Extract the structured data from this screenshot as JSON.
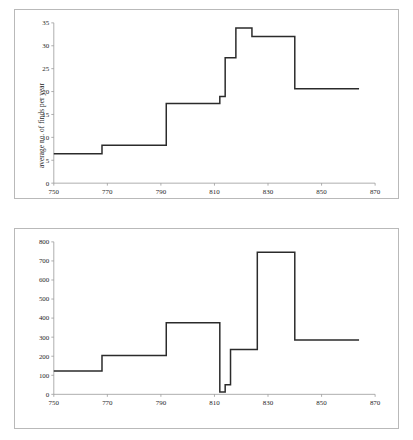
{
  "figure": {
    "background": "#ffffff",
    "frame_color": "#b9b9b9",
    "line_color": "#2b2b2b"
  },
  "chart_data": [
    {
      "type": "line",
      "subtype": "step",
      "id": "average-finds-per-year",
      "title": "",
      "xlabel": "",
      "ylabel": "average no. of finds per year",
      "xlim": [
        750,
        870
      ],
      "ylim": [
        0,
        35
      ],
      "xticks": [
        750,
        770,
        790,
        810,
        830,
        850,
        870
      ],
      "yticks": [
        0,
        5,
        10,
        15,
        20,
        25,
        30,
        35
      ],
      "xticklabels": [
        "750",
        "770",
        "790",
        "810",
        "830",
        "850",
        "870"
      ],
      "yticklabels": [
        "0",
        "5",
        "10",
        "15",
        "20",
        "25",
        "30",
        "35"
      ],
      "grid": false,
      "legend": null,
      "steps": [
        {
          "x_start": 750,
          "x_end": 768,
          "value": 6.4
        },
        {
          "x_start": 768,
          "x_end": 792,
          "value": 8.3
        },
        {
          "x_start": 792,
          "x_end": 812,
          "value": 17.4
        },
        {
          "x_start": 812,
          "x_end": 814,
          "value": 18.9
        },
        {
          "x_start": 814,
          "x_end": 818,
          "value": 27.4
        },
        {
          "x_start": 818,
          "x_end": 824,
          "value": 33.9
        },
        {
          "x_start": 824,
          "x_end": 840,
          "value": 32.0
        },
        {
          "x_start": 840,
          "x_end": 864,
          "value": 20.6
        }
      ]
    },
    {
      "type": "line",
      "subtype": "step",
      "id": "number-of-finds",
      "title": "",
      "xlabel": "",
      "ylabel": "number of finds",
      "xlim": [
        750,
        870
      ],
      "ylim": [
        0,
        800
      ],
      "xticks": [
        750,
        770,
        790,
        810,
        830,
        850,
        870
      ],
      "yticks": [
        0,
        100,
        200,
        300,
        400,
        500,
        600,
        700,
        800
      ],
      "xticklabels": [
        "750",
        "770",
        "790",
        "810",
        "830",
        "850",
        "870"
      ],
      "yticklabels": [
        "0",
        "100",
        "200",
        "300",
        "400",
        "500",
        "600",
        "700",
        "800"
      ],
      "grid": false,
      "legend": null,
      "steps": [
        {
          "x_start": 750,
          "x_end": 768,
          "value": 122
        },
        {
          "x_start": 768,
          "x_end": 792,
          "value": 204
        },
        {
          "x_start": 792,
          "x_end": 812,
          "value": 375
        },
        {
          "x_start": 812,
          "x_end": 814,
          "value": 12
        },
        {
          "x_start": 814,
          "x_end": 816,
          "value": 50
        },
        {
          "x_start": 816,
          "x_end": 826,
          "value": 235
        },
        {
          "x_start": 826,
          "x_end": 840,
          "value": 745
        },
        {
          "x_start": 840,
          "x_end": 864,
          "value": 285
        }
      ]
    }
  ]
}
